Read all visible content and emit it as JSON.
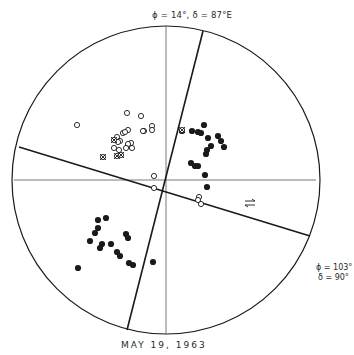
{
  "diagram": {
    "title": "MAY 19, 1963",
    "plane_labels": {
      "nodal_plane_1": "ϕ = 14°,  δ = 87°E",
      "nodal_plane_2_line1": "ϕ = 103°",
      "nodal_plane_2_line2": "δ = 90°"
    },
    "colors": {
      "background": "#ffffff",
      "ink": "#1a1a1a",
      "thin_line": "#555555"
    },
    "circle": {
      "cx": 166,
      "cy": 180,
      "r": 154
    },
    "axes": {
      "horizontal": {
        "x1": 14,
        "y1": 180,
        "x2": 316,
        "y2": 180
      },
      "vertical": {
        "x1": 166,
        "y1": 26,
        "x2": 166,
        "y2": 334
      }
    },
    "nodal_lines": [
      {
        "name": "phi-14",
        "x1": 203,
        "y1": 31,
        "x2": 127,
        "y2": 330
      },
      {
        "name": "phi-103",
        "x1": 19,
        "y1": 147,
        "x2": 310,
        "y2": 236
      }
    ],
    "slip_arrows": {
      "x": 250,
      "y": 203
    },
    "legend_symbols": {
      "filled": "compression (filled circle)",
      "open": "dilatation (open circle)",
      "cross": "nodal / uncertain (crossed circle)"
    },
    "filled_points": [
      [
        204,
        125
      ],
      [
        192,
        131
      ],
      [
        198,
        132
      ],
      [
        201,
        133
      ],
      [
        182,
        131
      ],
      [
        208,
        138
      ],
      [
        218,
        136
      ],
      [
        221,
        141
      ],
      [
        211,
        146
      ],
      [
        224,
        147
      ],
      [
        207,
        150
      ],
      [
        206,
        154
      ],
      [
        191,
        163
      ],
      [
        195,
        166
      ],
      [
        198,
        166
      ],
      [
        205,
        175
      ],
      [
        207,
        187
      ],
      [
        102,
        244
      ],
      [
        111,
        244
      ],
      [
        98,
        228
      ],
      [
        106,
        218
      ],
      [
        98,
        220
      ],
      [
        95,
        233
      ],
      [
        90,
        241
      ],
      [
        126,
        234
      ],
      [
        128,
        238
      ],
      [
        117,
        252
      ],
      [
        120,
        256
      ],
      [
        100,
        248
      ],
      [
        129,
        263
      ],
      [
        133,
        265
      ],
      [
        153,
        262
      ],
      [
        78,
        268
      ]
    ],
    "open_points": [
      [
        77,
        125
      ],
      [
        127,
        113
      ],
      [
        141,
        116
      ],
      [
        144,
        131
      ],
      [
        152,
        126
      ],
      [
        152,
        130
      ],
      [
        143,
        131
      ],
      [
        128,
        130
      ],
      [
        117,
        137
      ],
      [
        123,
        133
      ],
      [
        125,
        132
      ],
      [
        120,
        141
      ],
      [
        114,
        148
      ],
      [
        119,
        150
      ],
      [
        131,
        143
      ],
      [
        128,
        144
      ],
      [
        126,
        148
      ],
      [
        132,
        148
      ],
      [
        118,
        142
      ],
      [
        154,
        176
      ],
      [
        154,
        188
      ],
      [
        199,
        197
      ],
      [
        198,
        200
      ],
      [
        201,
        204
      ]
    ],
    "cross_points": [
      [
        103,
        157
      ],
      [
        117,
        156
      ],
      [
        121,
        155
      ],
      [
        114,
        140
      ],
      [
        182,
        130
      ]
    ]
  }
}
